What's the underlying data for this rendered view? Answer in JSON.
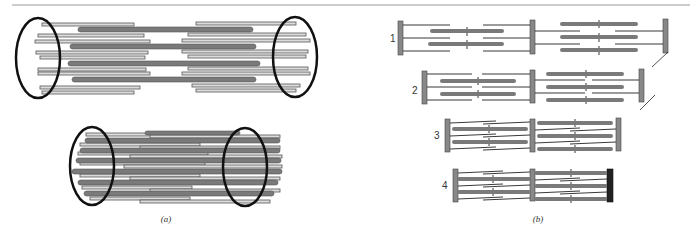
{
  "figure": {
    "panels": [
      {
        "id": "a",
        "caption": "(a)",
        "description": "Filament bundles in cylindrical arrangement, relaxed (top) and contracted (bottom)"
      },
      {
        "id": "b",
        "caption": "(b)",
        "description": "Sarcomere contraction sequence"
      }
    ],
    "stages": [
      {
        "label": "1"
      },
      {
        "label": "2"
      },
      {
        "label": "3"
      },
      {
        "label": "4"
      }
    ],
    "colors": {
      "thick_filament": "#7a7a7a",
      "thin_filament_fill": "#d8d8d8",
      "thin_filament_stroke": "#555555",
      "ring": "#111111",
      "z_disc": "#888888",
      "z_disc_dark": "#222222",
      "rule": "#999999"
    }
  }
}
